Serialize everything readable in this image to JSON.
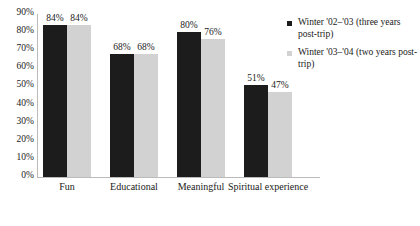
{
  "chart_data": {
    "type": "bar",
    "title": "",
    "subtitle": "",
    "xlabel": "",
    "ylabel": "",
    "ylim": [
      0,
      90
    ],
    "grid": false,
    "legend_position": "right",
    "categories": [
      "Fun",
      "Educational",
      "Meaningful",
      "Spiritual experience"
    ],
    "y_ticks": [
      "0%",
      "10%",
      "20%",
      "30%",
      "40%",
      "50%",
      "60%",
      "70%",
      "80%",
      "90%"
    ],
    "y_tick_values": [
      0,
      10,
      20,
      30,
      40,
      50,
      60,
      70,
      80,
      90
    ],
    "series": [
      {
        "name": "Winter '02–'03 (three years post-trip)",
        "color": "#1c1c1c",
        "values": [
          84,
          68,
          80,
          51
        ],
        "labels": [
          "84%",
          "68%",
          "80%",
          "51%"
        ]
      },
      {
        "name": "Winter '03–'04 (two years post-trip)",
        "color": "#d2d2d2",
        "values": [
          84,
          68,
          76,
          47
        ],
        "labels": [
          "84%",
          "68%",
          "76%",
          "47%"
        ]
      }
    ]
  },
  "legend": {
    "items": [
      {
        "label": "Winter '02–'03 (three years post-trip)",
        "color": "#1c1c1c"
      },
      {
        "label": "Winter '03–'04 (two years post-trip)",
        "color": "#d2d2d2"
      }
    ]
  },
  "axis": {
    "line_color": "#bbbbbb",
    "background": "#ffffff"
  }
}
